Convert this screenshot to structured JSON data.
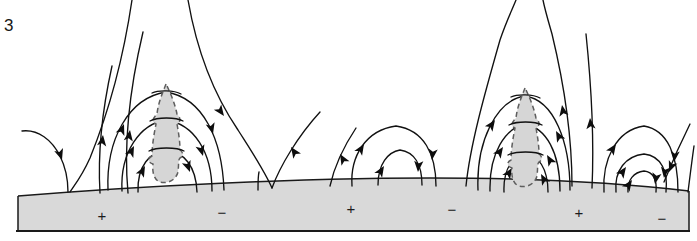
{
  "figure": {
    "number": "3",
    "width": 697,
    "height": 241,
    "background_color": "#ffffff",
    "line_color": "#111111",
    "surface_fill_color": "#d9d9d9",
    "plume_fill_color": "#d6d6d6",
    "plume_outline_color": "#5e5e5e"
  },
  "surface": {
    "label": "solar surface",
    "top_edge_peak_x": 430,
    "band_top_y_left": 196,
    "band_top_y_peak": 178,
    "band_top_y_right": 191,
    "band_bottom_y": 231
  },
  "polarities": [
    {
      "sign": "+",
      "x": 102,
      "y": 216
    },
    {
      "sign": "−",
      "x": 222,
      "y": 213
    },
    {
      "sign": "+",
      "x": 351,
      "y": 209
    },
    {
      "sign": "−",
      "x": 452,
      "y": 210
    },
    {
      "sign": "+",
      "x": 579,
      "y": 213
    },
    {
      "sign": "−",
      "x": 662,
      "y": 219
    }
  ],
  "structures": [
    {
      "name": "open-field-region-left",
      "x_range": [
        18,
        100
      ]
    },
    {
      "name": "arcade-left",
      "x_range": [
        95,
        250
      ],
      "has_plume": true
    },
    {
      "name": "open-field-region-center",
      "x_range": [
        255,
        330
      ]
    },
    {
      "name": "loop-pair-center",
      "x_range": [
        335,
        455
      ]
    },
    {
      "name": "arcade-right",
      "x_range": [
        460,
        600
      ],
      "has_plume": true
    },
    {
      "name": "loop-nest-right",
      "x_range": [
        595,
        690
      ]
    }
  ],
  "plumes": [
    {
      "name": "prominence-plume-left",
      "apex_x": 166,
      "apex_y": 84,
      "base_y": 176
    },
    {
      "name": "prominence-plume-right",
      "apex_x": 525,
      "apex_y": 88,
      "base_y": 178
    }
  ]
}
